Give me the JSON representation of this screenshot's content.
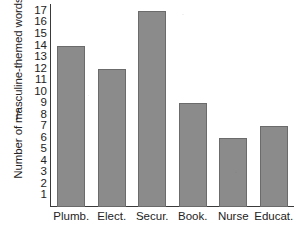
{
  "chart_data": {
    "type": "bar",
    "title": "",
    "subtitle": "",
    "xlabel": "",
    "ylabel": "Number of masculine-themed words",
    "y_axis_symbol": "f",
    "categories": [
      "Plumb.",
      "Elect.",
      "Secur.",
      "Book.",
      "Nurse",
      "Educat."
    ],
    "values": [
      14,
      12,
      17,
      9,
      6,
      7
    ],
    "ylim": [
      0,
      17.6
    ],
    "y_ticks": [
      17,
      16,
      15,
      14,
      13,
      12,
      11,
      10,
      9,
      8,
      7,
      6,
      5,
      4,
      3,
      2,
      1
    ],
    "grid": false,
    "legend": false,
    "legend_position": "none",
    "bar_color": "#8b8b8b",
    "bar_edge_color": "#6b6b6b",
    "axis_color": "#3a3a3a",
    "text_color": "#232323"
  }
}
